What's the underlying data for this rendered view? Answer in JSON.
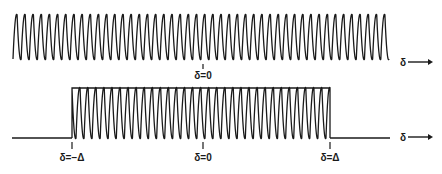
{
  "figure": {
    "top_panel": {
      "description": "Continuous sinusoid (unlimited extent)",
      "x_start": 13,
      "x_end": 389,
      "y_peak": 12,
      "y_trough": 62,
      "cycles": 46,
      "center_tick": {
        "x": 203,
        "label": "δ=0"
      },
      "axis_label": "δ"
    },
    "bottom_panel": {
      "description": "Sinusoid truncated to window [-Δ, Δ] with flat envelope line",
      "baseline_y": 138,
      "baseline_left": {
        "x_start": 12,
        "x_end": 72
      },
      "baseline_right": {
        "x_start": 330,
        "x_end": 390
      },
      "window": {
        "x_start": 72,
        "x_end": 330
      },
      "y_peak": 88,
      "y_trough": 138,
      "cycles": 32,
      "ticks": [
        {
          "x": 72,
          "label": "δ=−Δ"
        },
        {
          "x": 203,
          "label": "δ=0"
        },
        {
          "x": 330,
          "label": "δ=Δ"
        }
      ],
      "axis_label": "δ"
    },
    "colors": {
      "ink": "#1a1a1a",
      "background": "#ffffff"
    }
  }
}
